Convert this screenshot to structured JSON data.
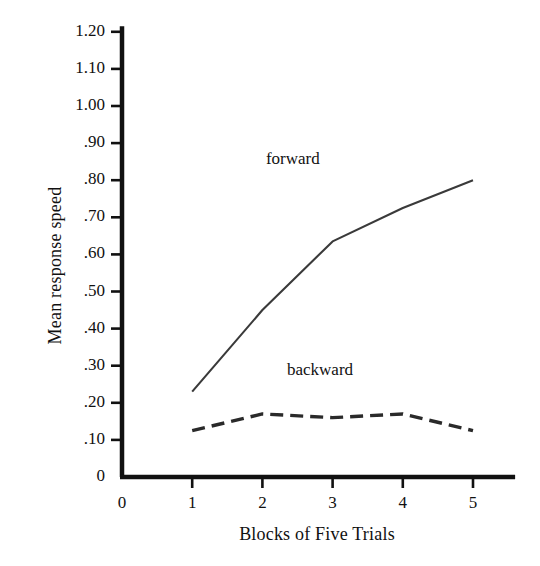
{
  "chart_data": {
    "type": "line",
    "title": "",
    "xlabel": "Blocks of Five Trials",
    "ylabel": "Mean response speed",
    "x": [
      1,
      2,
      3,
      4,
      5
    ],
    "xticks": [
      "0",
      "1",
      "2",
      "3",
      "4",
      "5"
    ],
    "xtick_values": [
      0,
      1,
      2,
      3,
      4,
      5
    ],
    "xlim": [
      0,
      5.6
    ],
    "yticks": [
      "0",
      ".10",
      ".20",
      ".30",
      ".40",
      ".50",
      ".60",
      ".70",
      ".80",
      ".90",
      "1.00",
      "1.10",
      "1.20"
    ],
    "ytick_values": [
      0,
      0.1,
      0.2,
      0.3,
      0.4,
      0.5,
      0.6,
      0.7,
      0.8,
      0.9,
      1.0,
      1.1,
      1.2
    ],
    "ylim": [
      0,
      1.28
    ],
    "grid": false,
    "legend_position": "inline-annotations",
    "series": [
      {
        "name": "forward",
        "label": "forward",
        "style": "solid",
        "color": "#3a3a3a",
        "values": [
          0.23,
          0.45,
          0.635,
          0.725,
          0.8
        ],
        "annotation": "forward"
      },
      {
        "name": "backward",
        "label": "backward",
        "style": "dashed",
        "color": "#2a2a2a",
        "values": [
          0.125,
          0.17,
          0.16,
          0.17,
          0.125
        ],
        "annotation": "backward"
      }
    ],
    "annotations": [
      {
        "text": "forward",
        "x": 2.05,
        "y": 0.855
      },
      {
        "text": "backward",
        "x": 2.35,
        "y": 0.285
      }
    ]
  },
  "axes": {
    "axis_color": "#111111",
    "background": "#ffffff"
  }
}
